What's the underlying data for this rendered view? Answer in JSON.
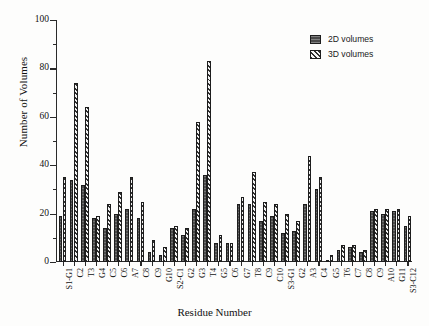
{
  "chart_data": {
    "type": "bar",
    "title": "",
    "xlabel": "Residue Number",
    "ylabel": "Number of Volumes",
    "ylim": [
      0,
      100
    ],
    "ytick_values": [
      0,
      20,
      40,
      60,
      80,
      100
    ],
    "ytick_labels": [
      "0",
      "20",
      "40",
      "60",
      "80",
      "100"
    ],
    "yminor_values": [
      10,
      30,
      50,
      70,
      90
    ],
    "grid": false,
    "legend_position": "top-right",
    "categories": [
      "S1-G1",
      "C2",
      "T3",
      "G4",
      "C5",
      "C6",
      "A7",
      "C8",
      "C9",
      "G10",
      "S2-C1",
      "G2",
      "G3",
      "T4",
      "G5",
      "C6",
      "G7",
      "T8",
      "C9",
      "C10",
      "S3-G1",
      "G2",
      "A3",
      "C4",
      "G5",
      "T6",
      "C7",
      "C8",
      "C9",
      "A10",
      "G11",
      "S3-C12"
    ],
    "series": [
      {
        "name": "2D volumes",
        "color": "#4a4a4a",
        "pattern": "solid",
        "values": [
          19,
          34,
          32,
          18,
          14,
          20,
          22,
          18,
          4,
          3,
          14,
          11,
          22,
          36,
          8,
          8,
          24,
          24,
          17,
          19,
          12,
          13,
          24,
          30,
          1,
          5,
          6,
          4,
          21,
          20,
          21,
          15
        ]
      },
      {
        "name": "3D volumes",
        "color": "#303030",
        "pattern": "diagonal-hatch",
        "values": [
          35,
          74,
          64,
          19,
          24,
          29,
          35,
          25,
          9,
          6,
          15,
          14,
          58,
          83,
          11,
          8,
          27,
          37,
          25,
          24,
          20,
          17,
          44,
          35,
          3,
          7,
          7,
          5,
          22,
          22,
          22,
          19
        ]
      }
    ]
  },
  "legend": {
    "entries": [
      {
        "label": "2D volumes",
        "icon": "solid-fill-swatch"
      },
      {
        "label": "3D volumes",
        "icon": "hatch-fill-swatch"
      }
    ]
  }
}
